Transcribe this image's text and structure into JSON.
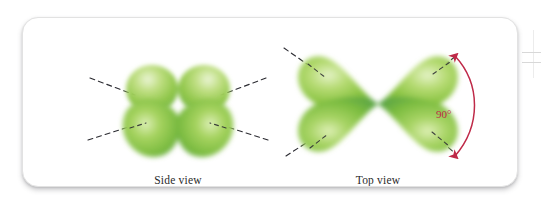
{
  "figure": {
    "name": "d-orbital-shape-illustration",
    "card": {
      "background_color": "#ffffff",
      "border_color": "#e2e2e2",
      "corner_radius_px": 16
    },
    "panels": [
      {
        "id": "side-view",
        "label": "Side view",
        "description": "Four-lobed orbital drawn edge-on, lobes meeting at a central node",
        "lobe_count": 4,
        "axis_guides": 4,
        "axis_guide_style": "dashed"
      },
      {
        "id": "top-view",
        "label": "Top view",
        "description": "Four-lobed cloverleaf orbital viewed from above",
        "lobe_count": 4,
        "axis_guides": 4,
        "axis_guide_style": "dashed"
      }
    ],
    "annotation": {
      "id": "angle-annotation",
      "label": "90°",
      "value": 90,
      "unit": "degrees",
      "color": "#bf2a48",
      "arrow_ends": "both"
    },
    "colors": {
      "lobe_light": "#b5d96a",
      "lobe_mid": "#8cc63f",
      "lobe_dark": "#55a247",
      "lobe_highlight": "#e8f3cf",
      "guide_line": "#2d2d33",
      "annotation": "#bf2a48",
      "label_text": "#2b2b2b"
    }
  }
}
